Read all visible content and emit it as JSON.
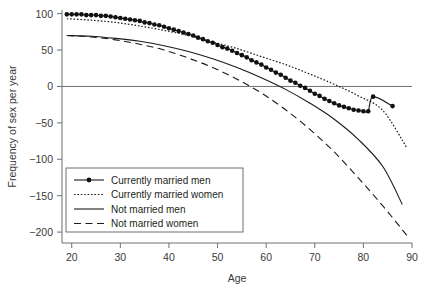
{
  "chart_data": {
    "type": "line",
    "title": "",
    "xlabel": "Age",
    "ylabel": "Frequency of sex per year",
    "xlim": [
      18,
      90
    ],
    "ylim": [
      -215,
      105
    ],
    "xticks": [
      20,
      30,
      40,
      50,
      60,
      70,
      80,
      90
    ],
    "xticklabels": [
      "20",
      "30",
      "40",
      "50",
      "60",
      "70",
      "80",
      "90"
    ],
    "yticks": [
      100,
      50,
      0,
      -50,
      -100,
      -150,
      -200
    ],
    "yticklabels": [
      "100",
      "50",
      "0",
      "−50",
      "−100",
      "−150",
      "−200"
    ],
    "grid": false,
    "legend_position": "lower-left-inside",
    "reference_lines": [
      {
        "axis": "y",
        "value": 0,
        "style": "solid"
      }
    ],
    "series": [
      {
        "name": "Currently married men",
        "style": "solid-with-markers",
        "marker": "filled-circle",
        "x": [
          19,
          20,
          21,
          22,
          23,
          24,
          25,
          26,
          27,
          28,
          29,
          30,
          31,
          32,
          33,
          34,
          35,
          36,
          37,
          38,
          39,
          40,
          41,
          42,
          43,
          44,
          45,
          46,
          47,
          48,
          49,
          50,
          51,
          52,
          53,
          54,
          55,
          56,
          57,
          58,
          59,
          60,
          61,
          62,
          63,
          64,
          65,
          66,
          67,
          68,
          69,
          70,
          71,
          72,
          73,
          74,
          75,
          76,
          77,
          78,
          79,
          80,
          81,
          82,
          86
        ],
        "y": [
          99,
          99,
          99,
          99,
          98,
          98,
          98,
          97,
          97,
          96,
          95,
          94,
          93,
          92,
          91,
          90,
          88,
          87,
          85,
          84,
          82,
          80,
          78,
          76,
          74,
          72,
          70,
          67,
          65,
          62,
          60,
          57,
          54,
          52,
          49,
          46,
          43,
          40,
          36,
          33,
          30,
          26,
          23,
          19,
          16,
          12,
          8,
          5,
          1,
          -2,
          -6,
          -10,
          -13,
          -17,
          -20,
          -23,
          -26,
          -28,
          -30,
          -32,
          -33,
          -34,
          -34,
          -14,
          -27
        ]
      },
      {
        "name": "Currently married women",
        "style": "dotted",
        "marker": "none",
        "x": [
          19,
          24,
          29,
          34,
          39,
          44,
          49,
          54,
          59,
          64,
          69,
          74,
          79,
          84,
          89
        ],
        "y": [
          93,
          91,
          88,
          83,
          77,
          70,
          61,
          52,
          41,
          30,
          17,
          3,
          -13,
          -33,
          -85
        ]
      },
      {
        "name": "Not married men",
        "style": "solid",
        "marker": "none",
        "x": [
          19,
          24,
          29,
          34,
          39,
          44,
          49,
          54,
          59,
          64,
          69,
          74,
          79,
          84,
          88
        ],
        "y": [
          70,
          69,
          66,
          62,
          56,
          48,
          38,
          26,
          12,
          -4,
          -23,
          -45,
          -73,
          -110,
          -162
        ]
      },
      {
        "name": "Not married women",
        "style": "dashed",
        "marker": "none",
        "x": [
          19,
          24,
          29,
          34,
          39,
          44,
          49,
          54,
          59,
          64,
          69,
          74,
          79,
          84,
          89
        ],
        "y": [
          70,
          68,
          64,
          58,
          50,
          39,
          26,
          10,
          -9,
          -32,
          -59,
          -90,
          -126,
          -164,
          -205
        ]
      }
    ]
  },
  "legend": {
    "items": [
      {
        "label": "Currently married men",
        "style": "solid-with-markers"
      },
      {
        "label": "Currently married women",
        "style": "dotted"
      },
      {
        "label": "Not married men",
        "style": "solid"
      },
      {
        "label": "Not married women",
        "style": "dashed"
      }
    ]
  }
}
